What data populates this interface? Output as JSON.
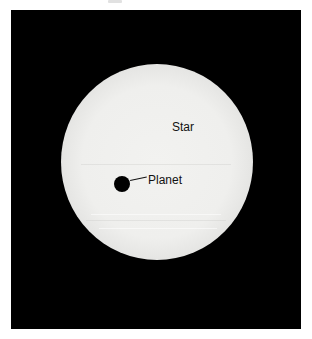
{
  "figure": {
    "background_color": "#000000",
    "star": {
      "label": "Star",
      "color": "#f0f0ee"
    },
    "planet": {
      "label": "Planet",
      "color": "#000000"
    }
  }
}
